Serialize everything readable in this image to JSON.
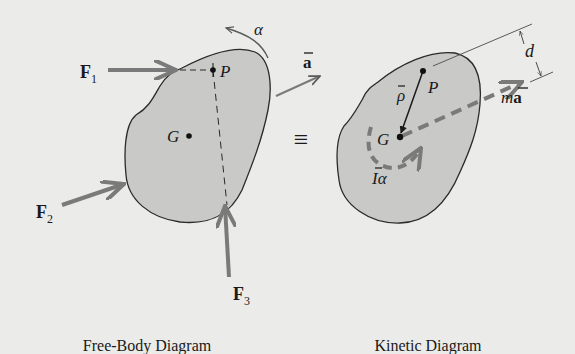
{
  "colors": {
    "background": "#ebebe9",
    "body_fill": "#c9c9c7",
    "outline": "#2a2a2a",
    "force_arrow": "#7a7a7a",
    "text": "#1a1a1a"
  },
  "free_body_diagram": {
    "caption": "Free-Body Diagram",
    "forces": [
      {
        "symbol": "F",
        "subscript": "1"
      },
      {
        "symbol": "F",
        "subscript": "2"
      },
      {
        "symbol": "F",
        "subscript": "3"
      }
    ],
    "points": {
      "P": "P",
      "G": "G"
    },
    "angular_acceleration": "α",
    "acceleration": {
      "symbol": "a",
      "overbar": true
    }
  },
  "equivalence_sign": "≡",
  "kinetic_diagram": {
    "caption": "Kinetic Diagram",
    "points": {
      "P": "P",
      "G": "G"
    },
    "rho": {
      "symbol": "ρ",
      "overbar": true
    },
    "inertia_term": {
      "I": "I",
      "alpha": "α",
      "overbar": true
    },
    "ma_term": {
      "m": "m",
      "a": "a",
      "overbar": true
    },
    "distance": "d"
  }
}
